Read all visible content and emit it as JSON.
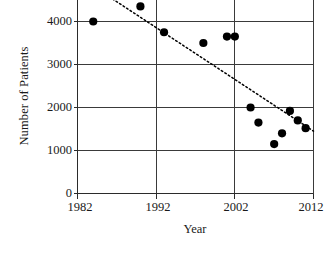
{
  "chart_data": {
    "type": "scatter",
    "title": "",
    "xlabel": "Year",
    "ylabel": "Number of Patients",
    "xlim": [
      1982,
      2012
    ],
    "ylim": [
      0,
      4500
    ],
    "xticks": [
      1982,
      1992,
      2002,
      2012
    ],
    "xtick_labels": [
      "1982",
      "1992",
      "2002",
      "2012"
    ],
    "yticks": [
      0,
      1000,
      2000,
      3000,
      4000
    ],
    "ytick_labels": [
      "0",
      "1000",
      "2000",
      "3000",
      "4000"
    ],
    "grid": "horizontal-and-vertical",
    "grid_y_values": [
      1000,
      2000,
      3000,
      4000
    ],
    "grid_x_values": [
      1992,
      2002
    ],
    "legend": "none",
    "marker": "filled-circle",
    "marker_color": "#000000",
    "note": "Top of plot area is cropped by the image frame; highest point is partially above the visible region.",
    "x": [
      1984,
      1990,
      1993,
      1998,
      2001,
      2002,
      2004,
      2005,
      2007,
      2008,
      2009,
      2010,
      2011
    ],
    "y": [
      4000,
      4350,
      3750,
      3500,
      3650,
      3650,
      2000,
      1650,
      1150,
      1400,
      1920,
      1700,
      1520
    ],
    "points": [
      {
        "x": 1984,
        "y": 4000
      },
      {
        "x": 1990,
        "y": 4350
      },
      {
        "x": 1993,
        "y": 3750
      },
      {
        "x": 1998,
        "y": 3500
      },
      {
        "x": 2001,
        "y": 3650
      },
      {
        "x": 2002,
        "y": 3650
      },
      {
        "x": 2004,
        "y": 2000
      },
      {
        "x": 2005,
        "y": 1650
      },
      {
        "x": 2007,
        "y": 1150
      },
      {
        "x": 2008,
        "y": 1400
      },
      {
        "x": 2009,
        "y": 1920
      },
      {
        "x": 2010,
        "y": 1700
      },
      {
        "x": 2011,
        "y": 1520
      }
    ],
    "trendline": {
      "type": "linear-dotted",
      "style": "dotted",
      "color": "#000000",
      "x_start": 1985,
      "y_start": 4700,
      "x_end": 2012,
      "y_end": 1450
    }
  },
  "axes": {
    "ylabel": "Number of Patients",
    "xlabel": "Year"
  }
}
